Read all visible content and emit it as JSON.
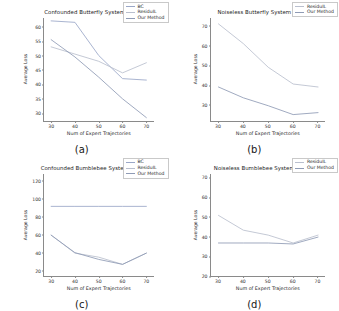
{
  "figure": {
    "shared": {
      "xlabel": "Num of Expert Trajectories",
      "ylabel": "Average Loss",
      "xticks": [
        "30",
        "40",
        "50",
        "60",
        "70"
      ],
      "series_names": {
        "bc": "BC",
        "residuil": "ResiduIL",
        "ours": "Our Method"
      }
    },
    "colors": {
      "bc": "#9aa7c7",
      "residuil": "#b9bfce",
      "ours": "#8f9bb5",
      "axis": "#8a8a8a",
      "text": "#262626",
      "background": "#ffffff"
    },
    "panels": [
      {
        "key": "a",
        "label": "(a)"
      },
      {
        "key": "b",
        "label": "(b)"
      },
      {
        "key": "c",
        "label": "(c)"
      },
      {
        "key": "d",
        "label": "(d)"
      }
    ]
  },
  "chart_data": [
    {
      "type": "line",
      "panel": "(a)",
      "title": "Confounded Butterfly System",
      "xlabel": "Num of Expert Trajectories",
      "ylabel": "Average Loss",
      "x": [
        30,
        40,
        50,
        60,
        70
      ],
      "xlim": [
        27,
        73
      ],
      "ylim": [
        27.5,
        63
      ],
      "yticks": [
        30,
        35,
        40,
        45,
        50,
        55,
        60
      ],
      "xticks": [
        30,
        40,
        50,
        60,
        70
      ],
      "grid": false,
      "legend_position": "upper right",
      "series": [
        {
          "name": "BC",
          "values": [
            62.0,
            61.5,
            50.0,
            42.0,
            41.5
          ]
        },
        {
          "name": "ResiduIL",
          "values": [
            53.0,
            50.5,
            48.0,
            44.0,
            47.5
          ]
        },
        {
          "name": "Our Method",
          "values": [
            55.5,
            49.5,
            42.5,
            35.0,
            28.5
          ]
        }
      ]
    },
    {
      "type": "line",
      "panel": "(b)",
      "title": "Noiseless Butterfly System",
      "xlabel": "Num of Expert Trajectories",
      "ylabel": "Average Loss",
      "x": [
        30,
        40,
        50,
        60,
        70
      ],
      "xlim": [
        27,
        73
      ],
      "ylim": [
        22,
        74
      ],
      "yticks": [
        30,
        40,
        50,
        60,
        70
      ],
      "xticks": [
        30,
        40,
        50,
        60,
        70
      ],
      "grid": false,
      "legend_position": "upper right",
      "series": [
        {
          "name": "ResiduIL",
          "values": [
            71.0,
            61.0,
            49.0,
            40.5,
            39.0
          ]
        },
        {
          "name": "Our Method",
          "values": [
            39.0,
            33.5,
            29.5,
            25.0,
            26.0
          ]
        }
      ]
    },
    {
      "type": "line",
      "panel": "(c)",
      "title": "Confounded Bumblebee System",
      "xlabel": "Num of Expert Trajectories",
      "ylabel": "Average Loss",
      "x": [
        30,
        40,
        50,
        60,
        70
      ],
      "xlim": [
        27,
        73
      ],
      "ylim": [
        14,
        128
      ],
      "yticks": [
        20,
        40,
        60,
        80,
        100,
        120
      ],
      "xticks": [
        30,
        40,
        50,
        60,
        70
      ],
      "grid": false,
      "legend_position": "upper right",
      "series": [
        {
          "name": "BC",
          "values": [
            92.0,
            92.0,
            92.0,
            92.0,
            92.0
          ]
        },
        {
          "name": "ResiduIL",
          "values": [
            60.0,
            40.0,
            35.5,
            27.5,
            40.0
          ]
        },
        {
          "name": "Our Method",
          "values": [
            60.0,
            40.5,
            33.0,
            27.5,
            40.0
          ]
        }
      ]
    },
    {
      "type": "line",
      "panel": "(d)",
      "title": "Noiseless Bumblebee System",
      "xlabel": "Num of Expert Trajectories",
      "ylabel": "Average Loss",
      "x": [
        30,
        40,
        50,
        60,
        70
      ],
      "xlim": [
        27,
        73
      ],
      "ylim": [
        20,
        72
      ],
      "yticks": [
        20,
        30,
        40,
        50,
        60,
        70
      ],
      "xticks": [
        30,
        40,
        50,
        60,
        70
      ],
      "grid": false,
      "legend_position": "upper right",
      "series": [
        {
          "name": "ResiduIL",
          "values": [
            51.0,
            43.5,
            41.0,
            37.0,
            41.0
          ]
        },
        {
          "name": "Our Method",
          "values": [
            37.0,
            37.0,
            37.0,
            36.5,
            40.0
          ]
        }
      ]
    }
  ]
}
